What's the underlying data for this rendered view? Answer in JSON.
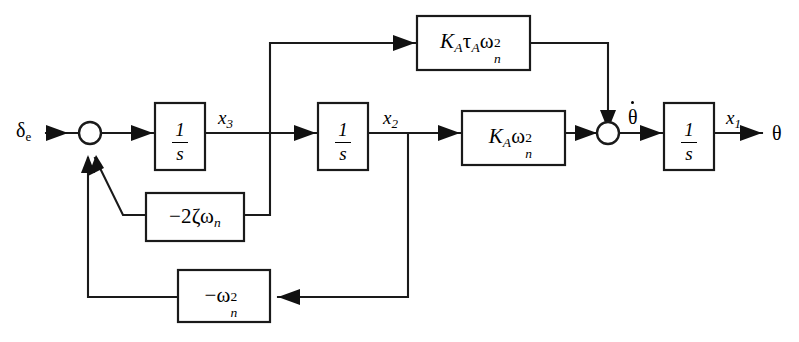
{
  "diagram": {
    "input": {
      "label": "δ",
      "subscript": "e"
    },
    "output": {
      "label": "θ"
    },
    "signals": {
      "x3": {
        "base": "x",
        "sub": "3"
      },
      "x2": {
        "base": "x",
        "sub": "2"
      },
      "x1": {
        "base": "x",
        "sub": "1"
      },
      "theta_dot": {
        "label": "θ",
        "accent": "dot"
      }
    },
    "blocks": [
      {
        "id": "integrator-3",
        "type": "integrator",
        "numerator": "1",
        "denominator": "s",
        "label": "1/s"
      },
      {
        "id": "integrator-2",
        "type": "integrator",
        "numerator": "1",
        "denominator": "s",
        "label": "1/s"
      },
      {
        "id": "integrator-1",
        "type": "integrator",
        "numerator": "1",
        "denominator": "s",
        "label": "1/s"
      },
      {
        "id": "gain-ka-tau-wn2",
        "type": "gain",
        "label": "K_A τ_A ω_n^2",
        "parts": {
          "k": "K",
          "k_sub": "A",
          "tau": "τ",
          "tau_sub": "A",
          "omega": "ω",
          "omega_sup": "2",
          "omega_sub": "n"
        }
      },
      {
        "id": "gain-ka-wn2",
        "type": "gain",
        "label": "K_A ω_n^2",
        "parts": {
          "k": "K",
          "k_sub": "A",
          "omega": "ω",
          "omega_sup": "2",
          "omega_sub": "n"
        }
      },
      {
        "id": "gain-minus-2-zeta-wn",
        "type": "gain",
        "label": "−2ζω_n",
        "parts": {
          "sign": "−",
          "coeff": "2",
          "zeta": "ζ",
          "omega": "ω",
          "omega_sub": "n"
        }
      },
      {
        "id": "gain-minus-wn2",
        "type": "gain",
        "label": "−ω_n^2",
        "parts": {
          "sign": "−",
          "omega": "ω",
          "omega_sup": "2",
          "omega_sub": "n"
        }
      }
    ],
    "summing_junctions": [
      {
        "id": "sum-input",
        "inputs": 3
      },
      {
        "id": "sum-rate",
        "inputs": 2
      }
    ],
    "colors": {
      "line": "#1a1a1a",
      "background": "#ffffff",
      "text": "#000000"
    }
  }
}
